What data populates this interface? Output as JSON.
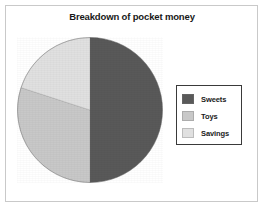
{
  "chart_data": {
    "type": "pie",
    "title": "Breakdown of pocket money",
    "xlabel": "",
    "ylabel": "",
    "categories": [
      "Sweets",
      "Toys",
      "Savings"
    ],
    "values": [
      50,
      30,
      20
    ],
    "unit": "percent",
    "legend_position": "right",
    "grid": false,
    "colors": [
      "#595959",
      "#c8c8c8",
      "#e0e0e0"
    ],
    "slices": [
      {
        "label": "Sweets",
        "value": 50,
        "color": "#595959",
        "start_angle_deg": 0,
        "end_angle_deg": 180
      },
      {
        "label": "Toys",
        "value": 30,
        "color": "#c8c8c8",
        "start_angle_deg": 180,
        "end_angle_deg": 288
      },
      {
        "label": "Savings",
        "value": 20,
        "color": "#e0e0e0",
        "start_angle_deg": 288,
        "end_angle_deg": 360
      }
    ]
  },
  "legend": {
    "items": [
      {
        "label": "Sweets",
        "color": "#595959"
      },
      {
        "label": "Toys",
        "color": "#c8c8c8"
      },
      {
        "label": "Savings",
        "color": "#e0e0e0"
      }
    ]
  },
  "style": {
    "frame_color": "#c9c9c9",
    "legend_border_color": "#3a3a3a",
    "text_color": "#181818",
    "background": "#ffffff"
  }
}
